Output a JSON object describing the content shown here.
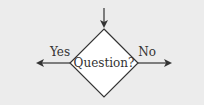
{
  "diagram": {
    "type": "flowchart-decision",
    "decision": {
      "label": "Question?",
      "shape": "diamond"
    },
    "branches": [
      {
        "label": "Yes",
        "direction": "left"
      },
      {
        "label": "No",
        "direction": "right"
      }
    ],
    "incoming": {
      "direction": "top"
    },
    "colors": {
      "background": "#ececec",
      "shape_fill": "#ffffff",
      "stroke": "#333333"
    }
  }
}
